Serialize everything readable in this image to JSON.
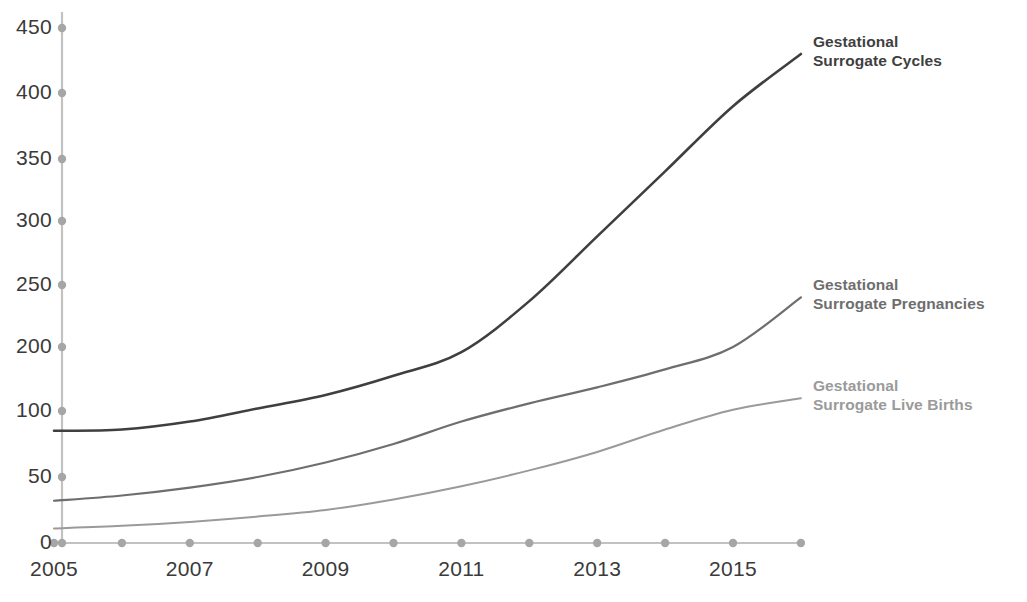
{
  "chart_data": {
    "type": "line",
    "title": "",
    "xlabel": "",
    "ylabel": "",
    "grid": false,
    "legend_position": "right-of-line-ends",
    "x": [
      2005,
      2006,
      2007,
      2008,
      2009,
      2010,
      2011,
      2012,
      2013,
      2014,
      2015,
      2016
    ],
    "x_tick_labels": [
      "2005",
      "",
      "2007",
      "",
      "2009",
      "",
      "2011",
      "",
      "2013",
      "",
      "2015",
      ""
    ],
    "y_tick_labels": [
      "0",
      "50",
      "100",
      "200",
      "250",
      "300",
      "350",
      "400",
      "450"
    ],
    "y_tick_values": [
      0,
      50,
      100,
      200,
      250,
      300,
      350,
      400,
      450
    ],
    "ylim": [
      0,
      475
    ],
    "series": [
      {
        "name": "Gestational Surrogate Cycles",
        "label_line1": "Gestational",
        "label_line2": "Surrogate Cycles",
        "color": "#3f3f3f",
        "values": [
          85,
          86,
          92,
          104,
          125,
          155,
          192,
          237,
          288,
          340,
          390,
          430
        ]
      },
      {
        "name": "Gestational Surrogate Pregnancies",
        "label_line1": "Gestational",
        "label_line2": "Surrogate Pregnancies",
        "color": "#6e6e6e",
        "values": [
          32,
          36,
          42,
          50,
          61,
          75,
          92,
          112,
          137,
          165,
          200,
          240
        ]
      },
      {
        "name": "Gestational Surrogate Live Births",
        "label_line1": "Gestational",
        "label_line2": "Surrogate Live Births",
        "color": "#9a9a9a",
        "values": [
          11,
          13,
          16,
          20,
          25,
          33,
          43,
          55,
          69,
          86,
          102,
          120
        ]
      }
    ]
  },
  "axis": {
    "axis_color": "#c2c2c2",
    "tick_dot_color": "#a6a6a6",
    "label_color": "#3a3a3a"
  }
}
